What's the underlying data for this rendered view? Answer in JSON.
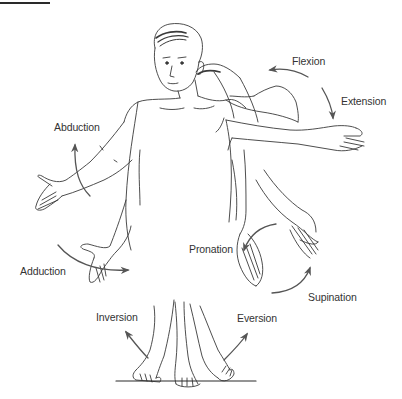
{
  "diagram": {
    "colors": {
      "line": "#3a3a3a",
      "arrow": "#555555",
      "text": "#333333",
      "background": "#ffffff"
    },
    "labels": {
      "flexion": "Flexion",
      "extension": "Extension",
      "abduction": "Abduction",
      "adduction": "Adduction",
      "pronation": "Pronation",
      "supination": "Supination",
      "inversion": "Inversion",
      "eversion": "Eversion"
    },
    "movement_pairs": [
      {
        "region": "elbow",
        "a": "Flexion",
        "b": "Extension"
      },
      {
        "region": "shoulder",
        "a": "Abduction",
        "b": "Adduction"
      },
      {
        "region": "forearm",
        "a": "Pronation",
        "b": "Supination"
      },
      {
        "region": "foot",
        "a": "Inversion",
        "b": "Eversion"
      }
    ]
  }
}
